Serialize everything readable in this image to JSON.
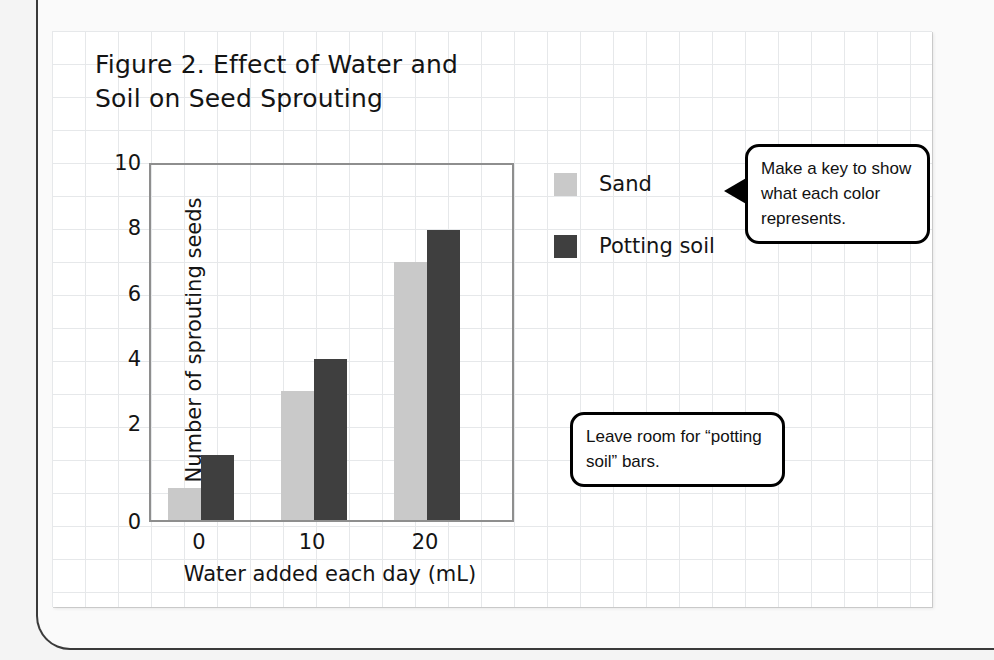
{
  "figure": {
    "title_line1": "Figure 2. Effect of Water and",
    "title_line2": "Soil on Seed Sprouting"
  },
  "chart_data": {
    "type": "bar",
    "title": "Figure 2. Effect of Water and Soil on Seed Sprouting",
    "xlabel": "Water added each day (mL)",
    "ylabel": "Number of sprouting seeds",
    "categories": [
      "0",
      "10",
      "20"
    ],
    "xtick_labels": [
      "0",
      "10",
      "20"
    ],
    "ytick_labels": [
      "10",
      "8",
      "6",
      "4",
      "2",
      "0"
    ],
    "ylim": [
      0,
      11
    ],
    "grid": true,
    "legend_position": "right",
    "series": [
      {
        "name": "Sand",
        "color": "#c9c9c9",
        "values": [
          1,
          4,
          8
        ]
      },
      {
        "name": "Potting soil",
        "color": "#3f3f3f",
        "values": [
          2,
          5,
          9
        ]
      }
    ]
  },
  "legend": {
    "items": [
      {
        "label": "Sand",
        "color": "#c9c9c9"
      },
      {
        "label": "Potting soil",
        "color": "#3f3f3f"
      }
    ]
  },
  "callouts": [
    {
      "text": "Make a key to show what each color represents."
    },
    {
      "text": "Leave room for “potting soil” bars."
    }
  ],
  "colors": {
    "sand": "#c9c9c9",
    "potting_soil": "#3f3f3f",
    "grid_line": "#e6e8ea",
    "axis": "#8e8e8e",
    "text": "#141414"
  }
}
